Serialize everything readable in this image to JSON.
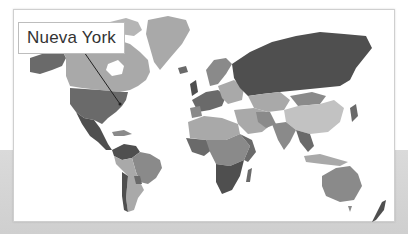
{
  "map": {
    "type": "world-political-choropleth",
    "style": "grayscale",
    "callout": {
      "label": "Nueva York",
      "target": "new-york-usa",
      "line_from": [
        84,
        52
      ],
      "line_to": [
        120,
        104
      ]
    },
    "colors": {
      "background_top": "#ffffff",
      "background_bottom": "#d6d6d6",
      "frame_border": "#cfcfcf",
      "ocean": "#ffffff",
      "dark": "#4f4f4f",
      "mid_dark": "#6a6a6a",
      "mid": "#8a8a8a",
      "light": "#a9a9a9",
      "lighter": "#c2c2c2",
      "leader_line": "#222222"
    }
  }
}
